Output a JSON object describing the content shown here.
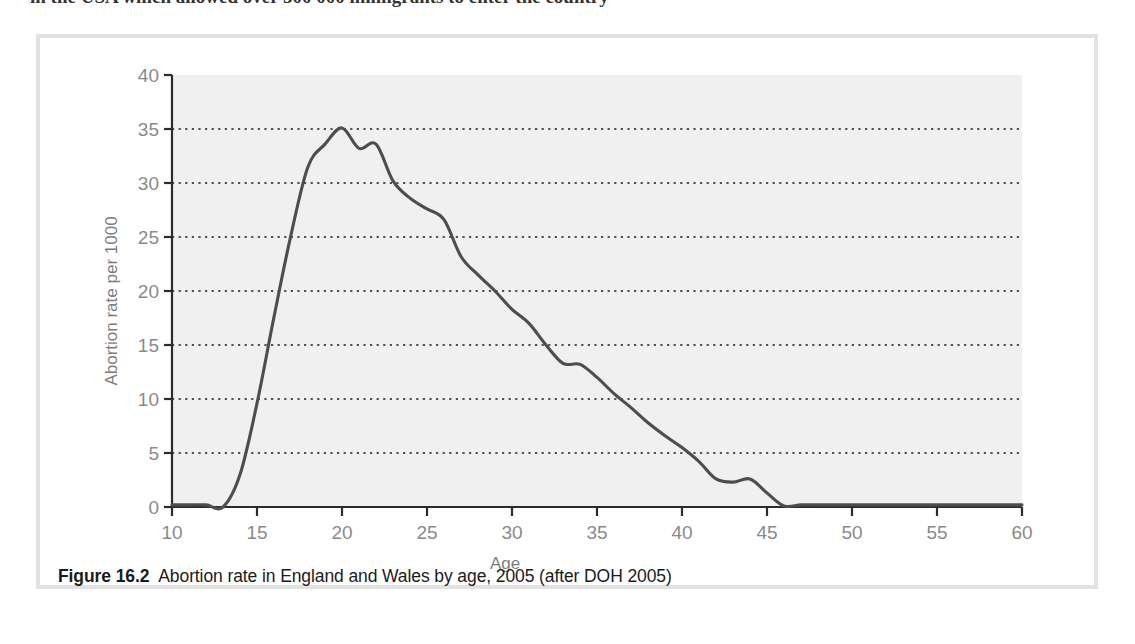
{
  "page": {
    "top_cut_text": "in the USA which allowed over 500 000 immigrants to enter the country"
  },
  "figure": {
    "caption_label": "Figure 16.2",
    "caption_text": "Abortion rate in England and Wales by age, 2005 (after DOH 2005)",
    "frame_color": "#e2e2e2"
  },
  "colors": {
    "plot_background": "#f0f0f0",
    "line": "#4d4d4d",
    "gridline": "#1a1a1a",
    "axis": "#2b2b2b",
    "tick_text": "#8a8a8a",
    "axis_title": "#7d7d7d",
    "caption_text": "#1b1b1b"
  },
  "chart_data": {
    "type": "line",
    "title": "",
    "xlabel": "Age",
    "ylabel": "Abortion rate per 1000",
    "xlim": [
      10,
      60
    ],
    "ylim": [
      0,
      40
    ],
    "xticks": [
      10,
      15,
      20,
      25,
      30,
      35,
      40,
      45,
      50,
      55,
      60
    ],
    "yticks": [
      0,
      5,
      10,
      15,
      20,
      25,
      30,
      35,
      40
    ],
    "xtick_labels": [
      "10",
      "15",
      "20",
      "25",
      "30",
      "35",
      "40",
      "45",
      "50",
      "55",
      "60"
    ],
    "ytick_labels": [
      "0",
      "5",
      "10",
      "15",
      "20",
      "25",
      "30",
      "35",
      "40"
    ],
    "grid": "horizontal-dotted",
    "legend": "none",
    "series": [
      {
        "name": "Abortion rate per 1000",
        "x": [
          10,
          11,
          12,
          13,
          14,
          15,
          16,
          17,
          18,
          19,
          20,
          21,
          22,
          23,
          24,
          25,
          26,
          27,
          28,
          29,
          30,
          31,
          32,
          33,
          34,
          35,
          36,
          37,
          38,
          39,
          40,
          41,
          42,
          43,
          44,
          45,
          46,
          47,
          48,
          49,
          50,
          51,
          52,
          53,
          54,
          55,
          56,
          57,
          58,
          59,
          60
        ],
        "values": [
          0.2,
          0.2,
          0.2,
          0.0,
          3.0,
          9.6,
          17.6,
          25.2,
          31.5,
          33.6,
          35.1,
          33.2,
          33.6,
          30.2,
          28.6,
          27.6,
          26.6,
          23.2,
          21.5,
          20.0,
          18.3,
          17.0,
          15.0,
          13.3,
          13.2,
          12.0,
          10.5,
          9.2,
          7.8,
          6.6,
          5.5,
          4.2,
          2.6,
          2.3,
          2.6,
          1.3,
          0.1,
          0.2,
          0.2,
          0.2,
          0.2,
          0.2,
          0.2,
          0.2,
          0.2,
          0.2,
          0.2,
          0.2,
          0.2,
          0.2,
          0.2
        ]
      }
    ],
    "annotations": {
      "peak_age": 20,
      "peak_value": 35.1
    }
  }
}
